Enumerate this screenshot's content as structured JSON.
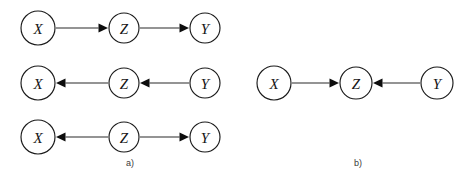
{
  "figure": {
    "type": "causal-graph-diagram",
    "background_color": "#ffffff",
    "node_stroke_color": "#1a1a1a",
    "node_fill_color": "#ffffff",
    "edge_color": "#2a2a2a",
    "arrowhead_color": "#0d0d0d",
    "label_color": "#151515",
    "caption_color": "#3a3a3a"
  },
  "chart_data": {
    "type": "diagram",
    "title": "",
    "panels": [
      {
        "id": "a",
        "caption": "a)",
        "caption_x": 130,
        "caption_y": 164,
        "graphs": [
          {
            "id": "a1",
            "name": "chain-forward",
            "nodes": [
              {
                "id": "a1-x",
                "label": "X",
                "cx": 38,
                "cy": 28,
                "r": 17
              },
              {
                "id": "a1-z",
                "label": "Z",
                "cx": 124,
                "cy": 28,
                "r": 15
              },
              {
                "id": "a1-y",
                "label": "Y",
                "cx": 205,
                "cy": 28,
                "r": 15
              }
            ],
            "edges": [
              {
                "id": "a1-e1",
                "from": "a1-x",
                "to": "a1-z",
                "direction": "right",
                "label": "X to Z"
              },
              {
                "id": "a1-e2",
                "from": "a1-z",
                "to": "a1-y",
                "direction": "right",
                "label": "Z to Y"
              }
            ]
          },
          {
            "id": "a2",
            "name": "chain-reverse",
            "nodes": [
              {
                "id": "a2-x",
                "label": "X",
                "cx": 38,
                "cy": 83,
                "r": 17
              },
              {
                "id": "a2-z",
                "label": "Z",
                "cx": 124,
                "cy": 83,
                "r": 15
              },
              {
                "id": "a2-y",
                "label": "Y",
                "cx": 205,
                "cy": 83,
                "r": 15
              }
            ],
            "edges": [
              {
                "id": "a2-e1",
                "from": "a2-z",
                "to": "a2-x",
                "direction": "left",
                "label": "Z to X"
              },
              {
                "id": "a2-e2",
                "from": "a2-y",
                "to": "a2-z",
                "direction": "left",
                "label": "Y to Z"
              }
            ]
          },
          {
            "id": "a3",
            "name": "fork",
            "nodes": [
              {
                "id": "a3-x",
                "label": "X",
                "cx": 38,
                "cy": 137,
                "r": 17
              },
              {
                "id": "a3-z",
                "label": "Z",
                "cx": 124,
                "cy": 137,
                "r": 15
              },
              {
                "id": "a3-y",
                "label": "Y",
                "cx": 205,
                "cy": 137,
                "r": 15
              }
            ],
            "edges": [
              {
                "id": "a3-e1",
                "from": "a3-z",
                "to": "a3-x",
                "direction": "left",
                "label": "Z to X"
              },
              {
                "id": "a3-e2",
                "from": "a3-z",
                "to": "a3-y",
                "direction": "right",
                "label": "Z to Y"
              }
            ]
          }
        ]
      },
      {
        "id": "b",
        "caption": "b)",
        "caption_x": 358,
        "caption_y": 164,
        "graphs": [
          {
            "id": "b1",
            "name": "collider",
            "nodes": [
              {
                "id": "b1-x",
                "label": "X",
                "cx": 274,
                "cy": 83,
                "r": 17
              },
              {
                "id": "b1-z",
                "label": "Z",
                "cx": 356,
                "cy": 83,
                "r": 16
              },
              {
                "id": "b1-y",
                "label": "Y",
                "cx": 437,
                "cy": 83,
                "r": 16
              }
            ],
            "edges": [
              {
                "id": "b1-e1",
                "from": "b1-x",
                "to": "b1-z",
                "direction": "right",
                "label": "X to Z"
              },
              {
                "id": "b1-e2",
                "from": "b1-y",
                "to": "b1-z",
                "direction": "left",
                "label": "Y to Z"
              }
            ]
          }
        ]
      }
    ]
  }
}
